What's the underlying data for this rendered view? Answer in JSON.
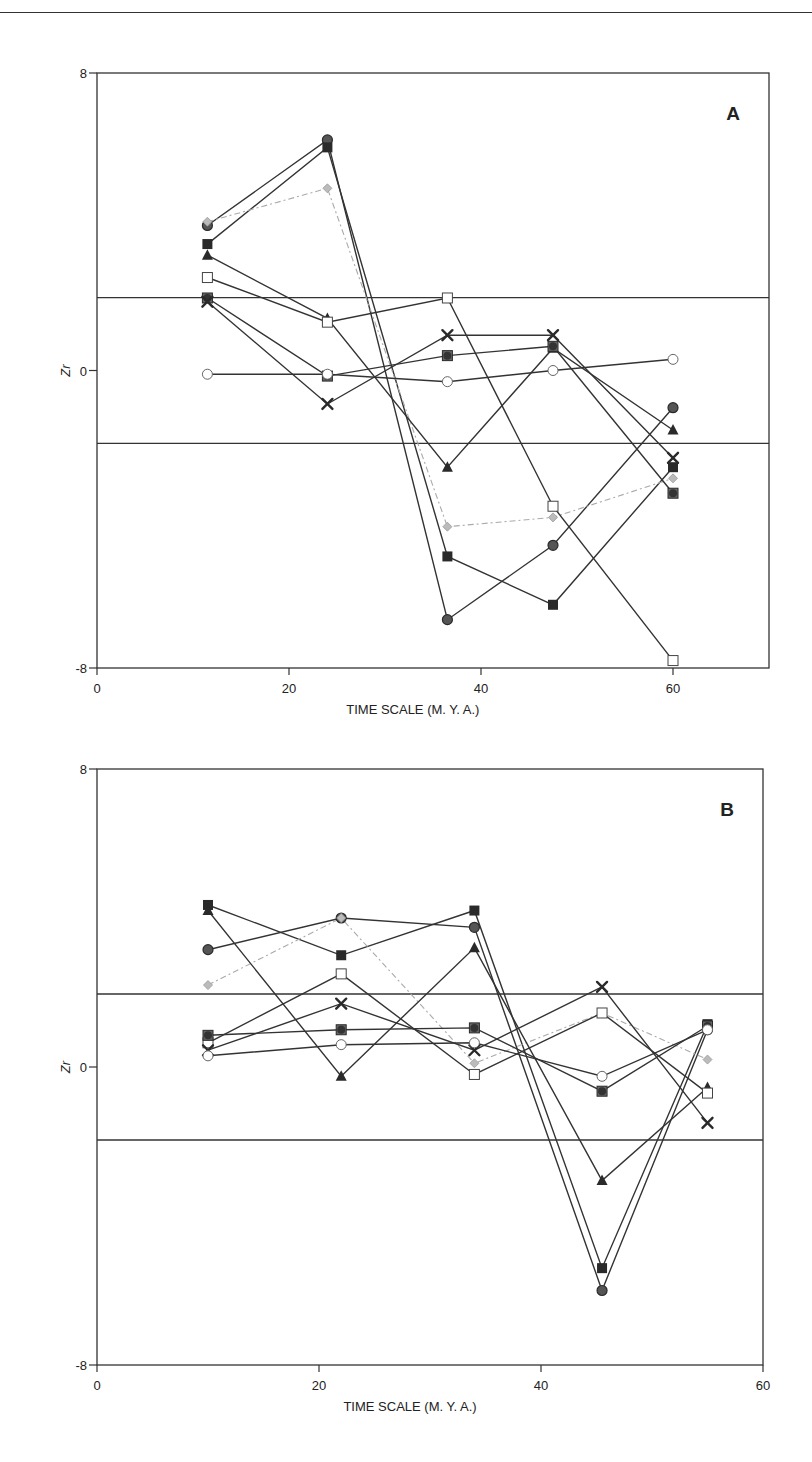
{
  "chart_data": [
    {
      "type": "line",
      "panel": "A",
      "title": "",
      "xlabel": "TIME SCALE (M. Y. A.)",
      "ylabel": "Zr",
      "xlim": [
        0,
        70
      ],
      "ylim": [
        -8,
        8
      ],
      "xticks": [
        0,
        20,
        40,
        60
      ],
      "yticks": [
        -8,
        0,
        8
      ],
      "reference_lines": [
        1.96,
        -1.96
      ],
      "grid": false,
      "legend": "none",
      "x": [
        11.5,
        24,
        36.5,
        47.5,
        60
      ],
      "series": [
        {
          "name": "filled-circle",
          "marker": "circle-filled",
          "color": "#444444",
          "values": [
            3.9,
            6.2,
            -6.7,
            -4.7,
            -1.0
          ]
        },
        {
          "name": "filled-square",
          "marker": "square-filled",
          "color": "#222222",
          "values": [
            3.4,
            6.0,
            -5.0,
            -6.3,
            -2.6
          ]
        },
        {
          "name": "grey-diamond",
          "marker": "diamond-grey",
          "color": "#aaaaaa",
          "dashed": true,
          "values": [
            4.0,
            4.9,
            -4.2,
            -3.95,
            -2.9
          ]
        },
        {
          "name": "filled-triangle",
          "marker": "triangle-filled",
          "color": "#222222",
          "values": [
            3.1,
            1.4,
            -2.6,
            0.6,
            -1.6
          ]
        },
        {
          "name": "open-square",
          "marker": "square-open",
          "color": "#333333",
          "values": [
            2.5,
            1.3,
            1.95,
            -3.65,
            -7.8
          ]
        },
        {
          "name": "circle-in-square",
          "marker": "circle-square",
          "color": "#333333",
          "values": [
            1.95,
            -0.15,
            0.4,
            0.65,
            -3.3
          ]
        },
        {
          "name": "cross",
          "marker": "cross",
          "color": "#222222",
          "values": [
            1.85,
            -0.9,
            0.95,
            0.95,
            -2.35
          ]
        },
        {
          "name": "open-circle",
          "marker": "circle-open",
          "color": "#555555",
          "values": [
            -0.1,
            -0.1,
            -0.3,
            0.0,
            0.3
          ]
        }
      ]
    },
    {
      "type": "line",
      "panel": "B",
      "title": "",
      "xlabel": "TIME SCALE (M. Y. A.)",
      "ylabel": "Zr",
      "xlim": [
        0,
        60
      ],
      "ylim": [
        -8,
        8
      ],
      "xticks": [
        0,
        20,
        40,
        60
      ],
      "yticks": [
        -8,
        0,
        8
      ],
      "reference_lines": [
        1.96,
        -1.96
      ],
      "grid": false,
      "legend": "none",
      "x": [
        10,
        22,
        34,
        45.5,
        55
      ],
      "series": [
        {
          "name": "filled-circle",
          "marker": "circle-filled",
          "color": "#444444",
          "values": [
            3.15,
            4.0,
            3.75,
            -6.0,
            1.0
          ]
        },
        {
          "name": "filled-square",
          "marker": "square-filled",
          "color": "#222222",
          "values": [
            4.35,
            3.0,
            4.2,
            -5.4,
            1.15
          ]
        },
        {
          "name": "grey-diamond",
          "marker": "diamond-grey",
          "color": "#aaaaaa",
          "dashed": true,
          "values": [
            2.2,
            4.0,
            0.1,
            1.45,
            0.2
          ]
        },
        {
          "name": "filled-triangle",
          "marker": "triangle-filled",
          "color": "#222222",
          "values": [
            4.2,
            -0.25,
            3.2,
            -3.05,
            -0.55
          ]
        },
        {
          "name": "open-square",
          "marker": "square-open",
          "color": "#333333",
          "values": [
            0.65,
            2.5,
            -0.2,
            1.45,
            -0.7
          ]
        },
        {
          "name": "circle-in-square",
          "marker": "circle-square",
          "color": "#333333",
          "values": [
            0.85,
            1.0,
            1.05,
            -0.65,
            1.1
          ]
        },
        {
          "name": "cross",
          "marker": "cross",
          "color": "#222222",
          "values": [
            0.45,
            1.7,
            0.45,
            2.15,
            -1.5
          ]
        },
        {
          "name": "open-circle",
          "marker": "circle-open",
          "color": "#555555",
          "values": [
            0.3,
            0.6,
            0.65,
            -0.25,
            1.0
          ]
        }
      ]
    }
  ],
  "panels": [
    {
      "letter": "A",
      "xlabel": "TIME SCALE (M. Y. A.)",
      "ylabel": "Zr",
      "ytick_labels": [
        "8",
        "0",
        "-8"
      ],
      "xtick_labels": [
        "0",
        "20",
        "40",
        "60"
      ]
    },
    {
      "letter": "B",
      "xlabel": "TIME SCALE (M. Y. A.)",
      "ylabel": "Zr",
      "ytick_labels": [
        "8",
        "0",
        "-8"
      ],
      "xtick_labels": [
        "0",
        "20",
        "40",
        "60"
      ]
    }
  ]
}
